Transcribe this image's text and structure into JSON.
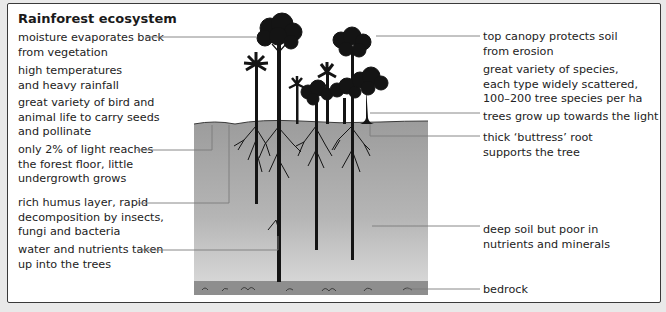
{
  "title": "Rainforest ecosystem",
  "left_labels": [
    {
      "id": "moisture",
      "text": "moisture evaporates back\nfrom vegetation"
    },
    {
      "id": "temperature",
      "text": "high temperatures\nand heavy rainfall"
    },
    {
      "id": "wildlife",
      "text": "great variety of bird and\nanimal life to carry seeds\nand pollinate"
    },
    {
      "id": "light",
      "text": "only 2% of light reaches\nthe forest floor, little\nundergrowth grows"
    },
    {
      "id": "humus",
      "text": "rich humus layer, rapid\ndecomposition by insects,\nfungi and bacteria"
    },
    {
      "id": "nutrients",
      "text": "water and nutrients taken\nup into the trees"
    }
  ],
  "right_labels": [
    {
      "id": "canopy",
      "text": "top canopy protects soil\nfrom erosion"
    },
    {
      "id": "species",
      "text": "great variety of species,\neach type widely scattered,\n100–200 tree species per ha"
    },
    {
      "id": "growth",
      "text": "trees grow up towards the light"
    },
    {
      "id": "buttress",
      "text": "thick ‘buttress’ root\nsupports the tree"
    },
    {
      "id": "soil",
      "text": "deep soil but poor in\nnutrients and minerals"
    },
    {
      "id": "bedrock",
      "text": "bedrock"
    }
  ],
  "colors": {
    "soil_top": "#9a9a9a",
    "soil_bottom": "#d4d4d4",
    "bedrock": "#8f8f8f",
    "trees": "#141414",
    "leader_lines": "#7a7a7a"
  }
}
